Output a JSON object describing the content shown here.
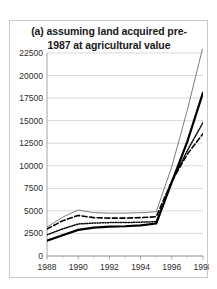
{
  "figure": {
    "title_line_1": "(a) assuming land acquired pre-",
    "title_line_2": "1987 at agricultural value"
  },
  "chart_data": {
    "type": "line",
    "xlabel": "",
    "ylabel": "",
    "xlim": [
      1988,
      1998
    ],
    "ylim": [
      0,
      22500
    ],
    "ytick_labels": [
      "0",
      "2500",
      "5000",
      "7500",
      "10000",
      "12500",
      "15000",
      "17500",
      "20000",
      "22500"
    ],
    "ytick_values": [
      0,
      2500,
      5000,
      7500,
      10000,
      12500,
      15000,
      17500,
      20000,
      22500
    ],
    "xtick_labels": [
      "1988",
      "1990",
      "1992",
      "1994",
      "1996",
      "1998"
    ],
    "xtick_values": [
      1988,
      1990,
      1992,
      1994,
      1996,
      1998
    ],
    "xminor_values": [
      1989,
      1991,
      1993,
      1995,
      1997
    ],
    "grid": "horizontal",
    "legend": "none",
    "x": [
      1988,
      1989,
      1990,
      1991,
      1992,
      1993,
      1994,
      1995,
      1996,
      1997,
      1998
    ],
    "series": [
      {
        "name": "series-thin-solid",
        "style": "solid-thin",
        "color": "#6e6e6e",
        "values": [
          3200,
          4300,
          5100,
          4800,
          4750,
          4750,
          4800,
          4900,
          9900,
          16200,
          23200
        ]
      },
      {
        "name": "series-thick-solid",
        "style": "solid-thick",
        "color": "#000000",
        "values": [
          1700,
          2300,
          2900,
          3150,
          3250,
          3300,
          3400,
          3600,
          8200,
          12700,
          18100
        ]
      },
      {
        "name": "series-dashed",
        "style": "dashed",
        "color": "#000000",
        "values": [
          3000,
          3900,
          4500,
          4250,
          4200,
          4200,
          4250,
          4350,
          8300,
          11300,
          13550
        ]
      },
      {
        "name": "series-dotted",
        "style": "dotted",
        "color": "#000000",
        "values": [
          2350,
          3000,
          3550,
          3650,
          3700,
          3700,
          3750,
          3800,
          8250,
          11700,
          14800
        ]
      }
    ]
  }
}
